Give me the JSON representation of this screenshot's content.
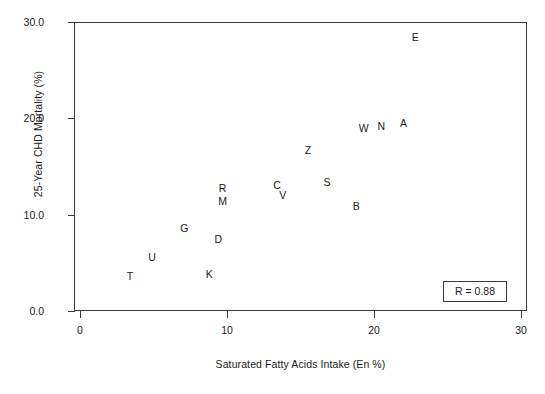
{
  "chart_data": {
    "type": "scatter",
    "title": "",
    "xlabel": "Saturated Fatty Acids Intake (En %)",
    "ylabel": "25-Year CHD Mortality (%)",
    "xlim": [
      0,
      30
    ],
    "ylim": [
      0,
      30
    ],
    "xticks": [
      "0",
      "10",
      "20",
      "30"
    ],
    "xtick_values": [
      0,
      10,
      20,
      30
    ],
    "yticks": [
      "0.0",
      "10.0",
      "20.0",
      "30.0"
    ],
    "ytick_values": [
      0,
      10,
      20,
      30
    ],
    "grid": false,
    "legend": "none",
    "annotation": "R = 0.88",
    "marker_style": "text-label",
    "points": [
      {
        "label": "T",
        "x": 3.4,
        "y": 3.5
      },
      {
        "label": "U",
        "x": 4.9,
        "y": 5.5
      },
      {
        "label": "G",
        "x": 7.1,
        "y": 8.5
      },
      {
        "label": "K",
        "x": 8.8,
        "y": 3.7
      },
      {
        "label": "D",
        "x": 9.4,
        "y": 7.4
      },
      {
        "label": "M",
        "x": 9.7,
        "y": 11.3
      },
      {
        "label": "R",
        "x": 9.7,
        "y": 12.7
      },
      {
        "label": "C",
        "x": 13.4,
        "y": 13.0
      },
      {
        "label": "V",
        "x": 13.8,
        "y": 11.9
      },
      {
        "label": "Z",
        "x": 15.5,
        "y": 16.6
      },
      {
        "label": "S",
        "x": 16.8,
        "y": 13.3
      },
      {
        "label": "B",
        "x": 18.8,
        "y": 10.8
      },
      {
        "label": "W",
        "x": 19.3,
        "y": 18.9
      },
      {
        "label": "N",
        "x": 20.5,
        "y": 19.1
      },
      {
        "label": "A",
        "x": 22.0,
        "y": 19.4
      },
      {
        "label": "E",
        "x": 22.8,
        "y": 28.3
      }
    ]
  },
  "colors": {
    "axis": "#3a3a3a",
    "text": "#1a1a1a",
    "background": "#ffffff"
  }
}
